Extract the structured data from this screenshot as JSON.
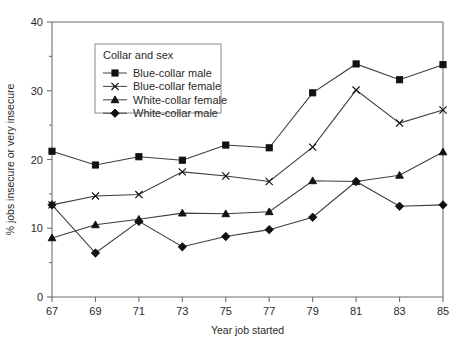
{
  "chart_data": {
    "type": "line",
    "title": "",
    "xlabel": "Year job started",
    "ylabel": "% jobs insecure or very insecure",
    "x": [
      67,
      69,
      71,
      73,
      75,
      77,
      79,
      81,
      83,
      85
    ],
    "xtick_labels": [
      "67",
      "69",
      "71",
      "73",
      "75",
      "77",
      "79",
      "81",
      "83",
      "85"
    ],
    "ytick_labels": [
      "0",
      "10",
      "20",
      "30",
      "40"
    ],
    "ytick_values": [
      0,
      10,
      20,
      30,
      40
    ],
    "xlim": [
      67,
      85
    ],
    "ylim": [
      0,
      40
    ],
    "grid": false,
    "legend_position": "upper-left-inside",
    "legend_title": "Collar and sex",
    "series": [
      {
        "name": "Blue-collar male",
        "marker": "square",
        "values": [
          21.2,
          19.2,
          20.4,
          19.9,
          22.1,
          21.7,
          29.7,
          33.9,
          31.6,
          33.8
        ]
      },
      {
        "name": "Blue-collar female",
        "marker": "x",
        "values": [
          13.4,
          14.7,
          14.9,
          18.2,
          17.6,
          16.8,
          21.8,
          30.1,
          25.3,
          27.2
        ]
      },
      {
        "name": "White-collar female",
        "marker": "triangle",
        "values": [
          8.6,
          10.5,
          11.3,
          12.2,
          12.1,
          12.4,
          16.9,
          16.8,
          17.7,
          21.1
        ]
      },
      {
        "name": "White-collar male",
        "marker": "diamond",
        "values": [
          13.4,
          6.4,
          11.0,
          7.3,
          8.8,
          9.8,
          11.6,
          16.8,
          13.2,
          13.4
        ]
      }
    ]
  },
  "colors": {
    "ink": "#111111",
    "line": "#3d3d3d",
    "axis": "#6e6e6e",
    "background": "#ffffff"
  }
}
